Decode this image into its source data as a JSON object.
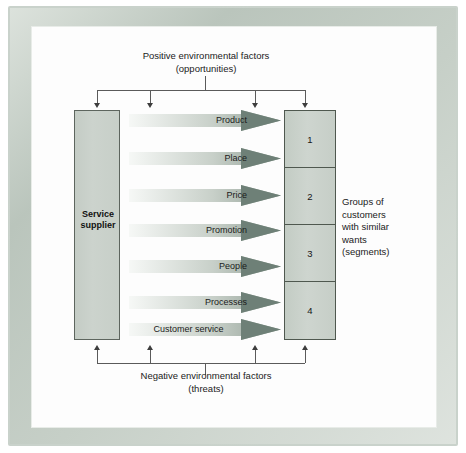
{
  "diagram": {
    "title_top": [
      "Positive environmental factors",
      "(opportunities)"
    ],
    "title_bottom": [
      "Negative environmental factors",
      "(threats)"
    ],
    "supplier": {
      "line1": "Service",
      "line2": "supplier"
    },
    "mix_elements": [
      {
        "label": "Product"
      },
      {
        "label": "Place"
      },
      {
        "label": "Price"
      },
      {
        "label": "Promotion"
      },
      {
        "label": "People"
      },
      {
        "label": "Processes"
      },
      {
        "label": "Customer service"
      }
    ],
    "segments": [
      {
        "label": "1"
      },
      {
        "label": "2"
      },
      {
        "label": "3"
      },
      {
        "label": "4"
      }
    ],
    "segments_caption": [
      "Groups of",
      "customers",
      "with similar",
      "wants",
      "(segments)"
    ],
    "colors": {
      "box_fill": "#ccd3cd",
      "box_border": "#4f584f",
      "arrow_head_dark": "#6b7d73",
      "arrow_tail_light": "#f4f6f4",
      "connector_line": "#5a5a5a",
      "frame": "#c3cdc5",
      "canvas": "#fdfdfd",
      "text": "#1b1b1b"
    }
  }
}
